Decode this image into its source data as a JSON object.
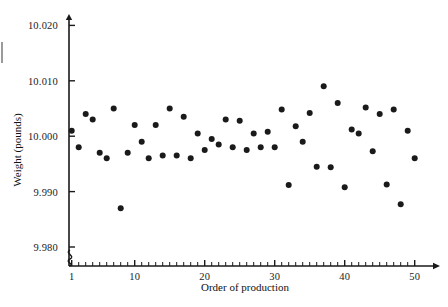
{
  "chart_data": {
    "type": "scatter",
    "title": "",
    "xlabel": "Order of production",
    "ylabel": "Weight (pounds)",
    "xlim": [
      0,
      51
    ],
    "ylim": [
      9.98,
      10.021
    ],
    "grid": false,
    "legend": null,
    "axis_break_y": true,
    "xticks": [
      1,
      10,
      20,
      30,
      40,
      50
    ],
    "xtick_labels": [
      "1",
      "10",
      "20",
      "30",
      "40",
      "50"
    ],
    "yticks": [
      9.98,
      9.99,
      10.0,
      10.01,
      10.02
    ],
    "ytick_labels": [
      "9.980",
      "9.990",
      "10.000",
      "10.010",
      "10.020"
    ],
    "x": [
      1,
      2,
      3,
      4,
      5,
      6,
      7,
      8,
      9,
      10,
      11,
      12,
      13,
      14,
      15,
      16,
      17,
      18,
      19,
      20,
      21,
      22,
      23,
      24,
      25,
      26,
      27,
      28,
      29,
      30,
      31,
      32,
      33,
      34,
      35,
      36,
      37,
      38,
      39,
      40,
      41,
      42,
      43,
      44,
      45,
      46,
      47,
      48,
      49,
      50
    ],
    "y": [
      10.001,
      9.998,
      10.004,
      10.003,
      9.997,
      9.996,
      10.005,
      9.987,
      9.997,
      10.002,
      9.999,
      9.996,
      10.002,
      9.9965,
      10.005,
      9.9965,
      10.0035,
      9.996,
      10.0005,
      9.9975,
      9.9995,
      9.9985,
      10.003,
      9.998,
      10.0028,
      9.9975,
      10.0005,
      9.998,
      10.0008,
      9.998,
      10.0048,
      9.9912,
      10.0018,
      9.999,
      10.0042,
      9.9945,
      10.009,
      9.9944,
      10.006,
      9.9908,
      10.0012,
      10.0005,
      10.0052,
      9.9973,
      10.004,
      9.9913,
      10.0048,
      9.9877,
      10.001,
      9.996
    ],
    "marker": {
      "shape": "circle",
      "color": "#1a1a1a",
      "size_px": 6
    },
    "axis_color": "#1a1a1a",
    "background": "#ffffff"
  },
  "axes": {
    "y_pixel_map": {
      "9.980": 247,
      "9.990": 191.6,
      "10.000": 136.2,
      "10.010": 80.8,
      "10.020": 25.4
    },
    "x_pixel_map": {
      "1": 71.7,
      "10": 134.7,
      "20": 204.7,
      "30": 274.7,
      "40": 344.7,
      "50": 414.7
    },
    "origin_x": 69,
    "baseline_y": 266,
    "arrow_top_y": 14,
    "arrow_right_x": 440
  }
}
